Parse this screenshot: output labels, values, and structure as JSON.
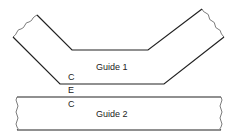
{
  "diagram": {
    "guides": [
      {
        "name": "guide-1",
        "label": "Guide 1"
      },
      {
        "name": "guide-2",
        "label": "Guide 2"
      }
    ],
    "gap_labels": {
      "upper_c": "C",
      "e": "E",
      "lower_c": "C"
    },
    "colors": {
      "line": "#222222",
      "background": "#ffffff"
    }
  }
}
